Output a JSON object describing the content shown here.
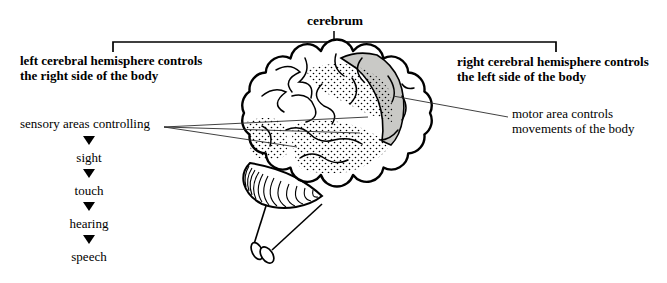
{
  "header": {
    "title": "cerebrum",
    "left_label": {
      "line1": "left cerebral hemisphere controls",
      "line2": "the right side of the body"
    },
    "right_label": {
      "line1": "right cerebral hemisphere controls",
      "line2": "the left side of the body"
    }
  },
  "sensory": {
    "label": "sensory areas controlling",
    "items": [
      "sight",
      "touch",
      "hearing",
      "speech"
    ]
  },
  "motor": {
    "line1": "motor area controls",
    "line2": "movements of the body"
  },
  "colors": {
    "motor_area_fill": "#c9c9c6",
    "ink": "#000000",
    "background": "#ffffff"
  }
}
